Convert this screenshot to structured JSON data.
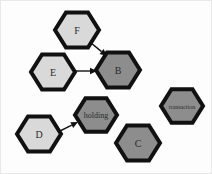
{
  "diagram": {
    "background_color": "#fdfdfd",
    "palette": {
      "node_light_fill": "#d9d9d9",
      "node_dark_fill": "#8d8d8d",
      "node_stroke": "#111111",
      "label_color": "#2a2a2a",
      "edge_color": "#111111"
    },
    "nodes": [
      {
        "id": "F",
        "label": "F",
        "fill": "#d9d9d9",
        "shade": "light",
        "cx": 76,
        "cy": 29,
        "radius": 22,
        "stroke_width": 4,
        "font_size": 10
      },
      {
        "id": "E",
        "label": "E",
        "fill": "#d9d9d9",
        "shade": "light",
        "cx": 52,
        "cy": 71,
        "radius": 22,
        "stroke_width": 4,
        "font_size": 10
      },
      {
        "id": "B",
        "label": "B",
        "fill": "#8d8d8d",
        "shade": "dark",
        "cx": 117,
        "cy": 69,
        "radius": 22,
        "stroke_width": 4,
        "font_size": 10
      },
      {
        "id": "D",
        "label": "D",
        "fill": "#d9d9d9",
        "shade": "light",
        "cx": 38,
        "cy": 133,
        "radius": 22,
        "stroke_width": 4,
        "font_size": 10
      },
      {
        "id": "holding",
        "label": "holding",
        "fill": "#8d8d8d",
        "shade": "dark",
        "cx": 95,
        "cy": 114,
        "radius": 21,
        "stroke_width": 4,
        "font_size": 8
      },
      {
        "id": "C",
        "label": "C",
        "fill": "#8d8d8d",
        "shade": "dark",
        "cx": 137,
        "cy": 142,
        "radius": 22,
        "stroke_width": 4,
        "font_size": 10
      },
      {
        "id": "transaction",
        "label": "transaction",
        "fill": "#8d8d8d",
        "shade": "dark",
        "cx": 181,
        "cy": 105,
        "radius": 21,
        "stroke_width": 4,
        "font_size": 6
      }
    ],
    "edges": [
      {
        "id": "F-to-B",
        "from": "F",
        "to": "B",
        "x1": 90,
        "y1": 42,
        "x2": 106,
        "y2": 55,
        "stroke_width": 1.4
      },
      {
        "id": "E-to-B",
        "from": "E",
        "to": "B",
        "x1": 74,
        "y1": 70,
        "x2": 96,
        "y2": 70,
        "stroke_width": 1.4
      },
      {
        "id": "D-to-holding",
        "from": "D",
        "to": "holding",
        "x1": 55,
        "y1": 132,
        "x2": 77,
        "y2": 121,
        "stroke_width": 1.4
      }
    ]
  }
}
